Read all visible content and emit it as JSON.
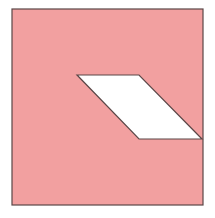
{
  "figure": {
    "colors": {
      "fill": "#F2A0A0",
      "stroke": "#5a4646",
      "hole": "#ffffff",
      "background": "#ffffff"
    },
    "square": {
      "x": 12,
      "y": 9,
      "width": 191,
      "height": 196
    },
    "parallelogram": {
      "points": [
        [
          77,
          75
        ],
        [
          139,
          75
        ],
        [
          202,
          139
        ],
        [
          139,
          139
        ]
      ]
    }
  }
}
